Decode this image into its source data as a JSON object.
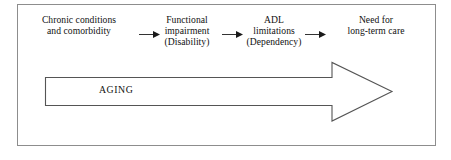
{
  "figure": {
    "kind": "flow-diagram",
    "title": "",
    "border_color": "#8d8d8d",
    "background_color": "#ffffff",
    "text_color": "#111111",
    "line_color": "#333333"
  },
  "flow": {
    "nodes": [
      {
        "id": "chronic-conditions",
        "lines": [
          "Chronic conditions",
          "and comorbidity"
        ]
      },
      {
        "id": "functional-impairment",
        "lines": [
          "Functional",
          "impairment",
          "(Disability)"
        ]
      },
      {
        "id": "adl-limitations",
        "lines": [
          "ADL",
          "limitations",
          "(Dependency)"
        ]
      },
      {
        "id": "need-for-long-term-care",
        "lines": [
          "Need for",
          "long-term care"
        ]
      }
    ],
    "connectors": [
      {
        "id": "connector-1",
        "icon": "right-arrow-icon"
      },
      {
        "id": "connector-2",
        "icon": "right-arrow-icon"
      },
      {
        "id": "connector-3",
        "icon": "right-arrow-icon"
      }
    ]
  },
  "aging": {
    "label": "AGING",
    "icon": "block-right-arrow-icon",
    "direction": "right"
  }
}
